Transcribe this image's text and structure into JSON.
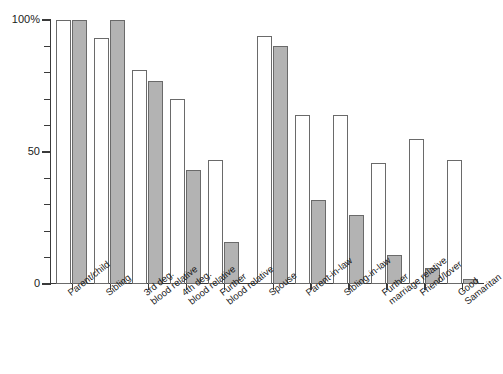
{
  "chart_data": {
    "type": "bar",
    "title": "",
    "subtitle": "",
    "xlabel": "",
    "ylabel": "",
    "ylim": [
      0,
      100
    ],
    "yticks": [
      0,
      10,
      20,
      30,
      40,
      50,
      60,
      70,
      80,
      90,
      100
    ],
    "ytick_labels": [
      "0",
      "",
      "",
      "",
      "",
      "50",
      "",
      "",
      "",
      "",
      "100%"
    ],
    "grid": false,
    "legend_position": "none",
    "categories": [
      "Parent/child",
      "Sibling",
      "3rd deg.\nblood relative",
      "4th deg.\nblood relative",
      "Further\nblood relative",
      "Spouse",
      "Parent-in-law",
      "Sibling-in-law",
      "Further\nmarriage relative",
      "Friend/lover",
      "Good\nSamaritan"
    ],
    "series": [
      {
        "name": "open",
        "style": "white-outlined",
        "color": "#ffffff",
        "values": [
          100,
          93,
          81,
          70,
          47,
          94,
          64,
          64,
          46,
          55,
          47
        ]
      },
      {
        "name": "filled",
        "style": "gray-filled",
        "color": "#b3b3b3",
        "values": [
          100,
          100,
          77,
          43,
          16,
          90,
          32,
          26,
          11,
          6,
          2
        ]
      }
    ],
    "group_gap_after": [
      4
    ],
    "bar_outline_color": "#6a6a6a",
    "axis_color": "#3a3a3a"
  }
}
